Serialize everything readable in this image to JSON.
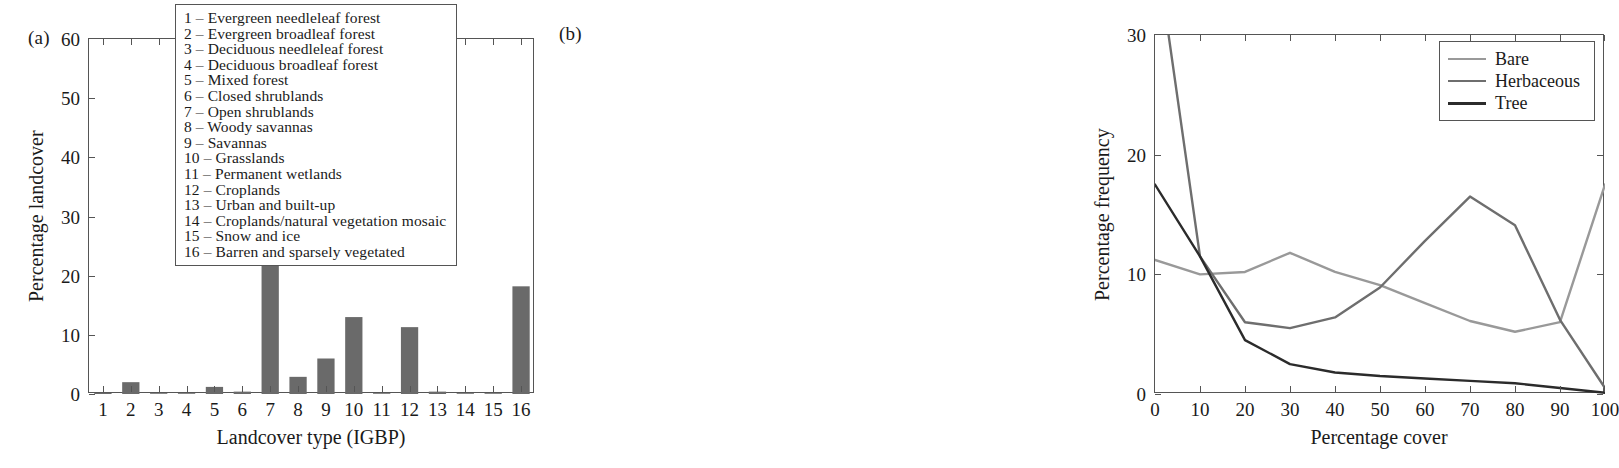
{
  "figure": {
    "panel_a_label": "(a)",
    "panel_b_label": "(b)"
  },
  "panel_a": {
    "xlabel": "Landcover type (IGBP)",
    "ylabel": "Percentage landcover",
    "legend_title": "",
    "legend_items": [
      "1 – Evergreen needleleaf forest",
      "2 – Evergreen broadleaf forest",
      "3 – Deciduous needleleaf forest",
      "4 – Deciduous broadleaf forest",
      "5 – Mixed forest",
      "6 – Closed shrublands",
      "7 – Open shrublands",
      "8 – Woody savannas",
      "9 – Savannas",
      "10 – Grasslands",
      "11 – Permanent wetlands",
      "12 – Croplands",
      "13 – Urban and built-up",
      "14 – Croplands/natural vegetation mosaic",
      "15 – Snow and ice",
      "16 – Barren and sparsely vegetated"
    ]
  },
  "panel_b": {
    "xlabel": "Percentage cover",
    "ylabel": "Percentage frequency",
    "legend_items": [
      {
        "label": "Bare",
        "color": "#999999"
      },
      {
        "label": "Herbaceous",
        "color": "#6e6e6e"
      },
      {
        "label": "Tree",
        "color": "#2b2b2b"
      }
    ]
  },
  "chart_data": [
    {
      "type": "bar",
      "panel": "(a)",
      "title": "",
      "xlabel": "Landcover type (IGBP)",
      "ylabel": "Percentage landcover",
      "categories": [
        "1",
        "2",
        "3",
        "4",
        "5",
        "6",
        "7",
        "8",
        "9",
        "10",
        "11",
        "12",
        "13",
        "14",
        "15",
        "16"
      ],
      "values": [
        0.2,
        2.0,
        0.05,
        0.05,
        1.2,
        0.4,
        43.5,
        2.9,
        6.0,
        13.0,
        0.1,
        11.3,
        0.4,
        0.1,
        0.1,
        18.2
      ],
      "xlim": [
        0.5,
        16.5
      ],
      "ylim": [
        0,
        60
      ],
      "yticks": [
        0,
        10,
        20,
        30,
        40,
        50,
        60
      ],
      "xticks": [
        "1",
        "2",
        "3",
        "4",
        "5",
        "6",
        "7",
        "8",
        "9",
        "10",
        "11",
        "12",
        "13",
        "14",
        "15",
        "16"
      ],
      "bar_color": "#6a6a6a",
      "grid": false,
      "legend_position": "upper center"
    },
    {
      "type": "line",
      "panel": "(b)",
      "title": "",
      "xlabel": "Percentage cover",
      "ylabel": "Percentage frequency",
      "x": [
        0,
        10,
        20,
        30,
        40,
        50,
        60,
        70,
        80,
        90,
        100
      ],
      "series": [
        {
          "name": "Bare",
          "color": "#999999",
          "values": [
            11.2,
            10.0,
            10.2,
            11.8,
            10.2,
            9.1,
            7.6,
            6.1,
            5.2,
            6.0,
            17.5
          ]
        },
        {
          "name": "Herbaceous",
          "color": "#6e6e6e",
          "values": [
            38.0,
            11.5,
            6.0,
            5.5,
            6.4,
            8.9,
            12.8,
            16.5,
            14.1,
            6.2,
            0.5
          ]
        },
        {
          "name": "Tree",
          "color": "#2b2b2b",
          "values": [
            17.5,
            11.5,
            4.5,
            2.5,
            1.8,
            1.5,
            1.3,
            1.1,
            0.9,
            0.5,
            0.1
          ]
        }
      ],
      "xlim": [
        0,
        100
      ],
      "ylim": [
        0,
        30
      ],
      "yticks": [
        0,
        10,
        20,
        30
      ],
      "xticks": [
        0,
        10,
        20,
        30,
        40,
        50,
        60,
        70,
        80,
        90,
        100
      ],
      "grid": false,
      "legend_position": "upper right"
    }
  ]
}
